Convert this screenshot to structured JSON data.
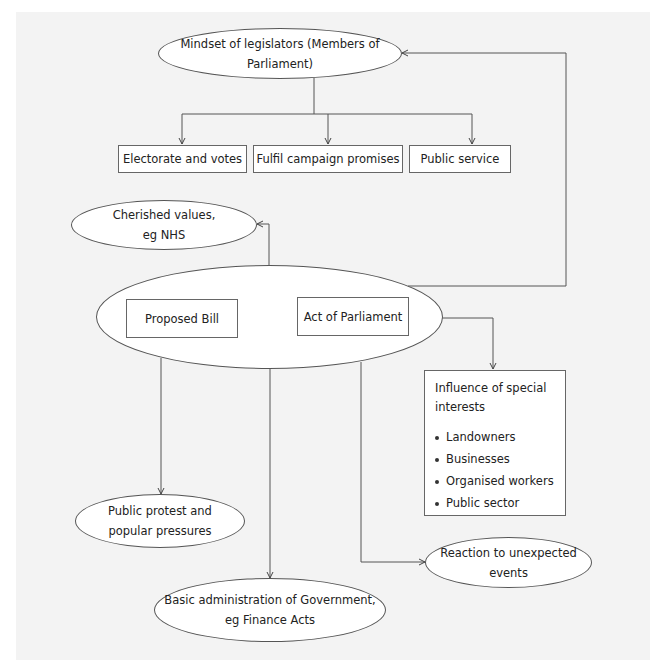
{
  "diagram": {
    "top": {
      "label": "Mindset of legislators (Members of Parliament)"
    },
    "motives": [
      {
        "label": "Electorate and votes"
      },
      {
        "label": "Fulfil campaign promises"
      },
      {
        "label": "Public service"
      }
    ],
    "cherished": {
      "line1": "Cherished values,",
      "line2": "eg NHS"
    },
    "core": {
      "bill": "Proposed Bill",
      "act": "Act of Parliament"
    },
    "influence": {
      "title_line1": "Influence of special",
      "title_line2": "interests",
      "items": [
        "Landowners",
        "Businesses",
        "Organised workers",
        "Public sector"
      ]
    },
    "protest": {
      "line1": "Public protest and",
      "line2": "popular pressures"
    },
    "reaction": {
      "line1": "Reaction to unexpected",
      "line2": "events"
    },
    "admin": {
      "line1": "Basic administration of Government,",
      "line2": "eg Finance Acts"
    },
    "colors": {
      "background": "#f3f3f3",
      "line": "#555555",
      "node_fill": "#ffffff"
    }
  }
}
